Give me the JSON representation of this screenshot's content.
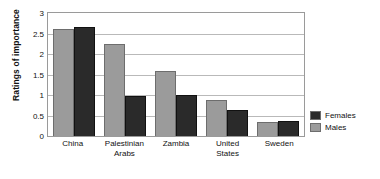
{
  "chart_data": {
    "type": "bar",
    "title": "",
    "xlabel": "",
    "ylabel": "Ratings of importance",
    "ylim": [
      0,
      3
    ],
    "ytick_labels": [
      "3",
      "2.5",
      "2",
      "1.5",
      "1",
      "0.5",
      "0"
    ],
    "ytick_values": [
      3,
      2.5,
      2,
      1.5,
      1,
      0.5,
      0
    ],
    "grid": true,
    "legend_position": "right",
    "categories": [
      "China",
      "Palestinian Arabs",
      "Zambia",
      "United States",
      "Sweden"
    ],
    "category_lines": [
      [
        "China"
      ],
      [
        "Palestinian",
        "Arabs"
      ],
      [
        "Zambia"
      ],
      [
        "United",
        "States"
      ],
      [
        "Sweden"
      ]
    ],
    "series": [
      {
        "name": "Males",
        "color": "#9b9b9b",
        "values": [
          2.6,
          2.25,
          1.58,
          0.88,
          0.33
        ]
      },
      {
        "name": "Females",
        "color": "#2a2a2a",
        "values": [
          2.67,
          0.97,
          1.0,
          0.63,
          0.37
        ]
      }
    ]
  },
  "legend": {
    "items": [
      {
        "label": "Females",
        "color": "#2a2a2a"
      },
      {
        "label": "Males",
        "color": "#9b9b9b"
      }
    ]
  }
}
